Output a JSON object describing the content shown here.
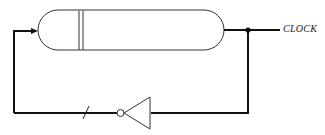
{
  "diagram": {
    "type": "ring-oscillator clock circuit",
    "components": {
      "delay_line": {
        "name": "delay line / shift register",
        "divider_lines": 2
      },
      "inverter": {
        "name": "inverter (NOT gate)"
      },
      "junction": {
        "name": "output junction dot"
      },
      "bus_slash": {
        "name": "wire slash mark"
      }
    },
    "labels": {
      "output": "CLOCK"
    },
    "colors": {
      "stroke": "#222222",
      "background": "#ffffff"
    }
  }
}
